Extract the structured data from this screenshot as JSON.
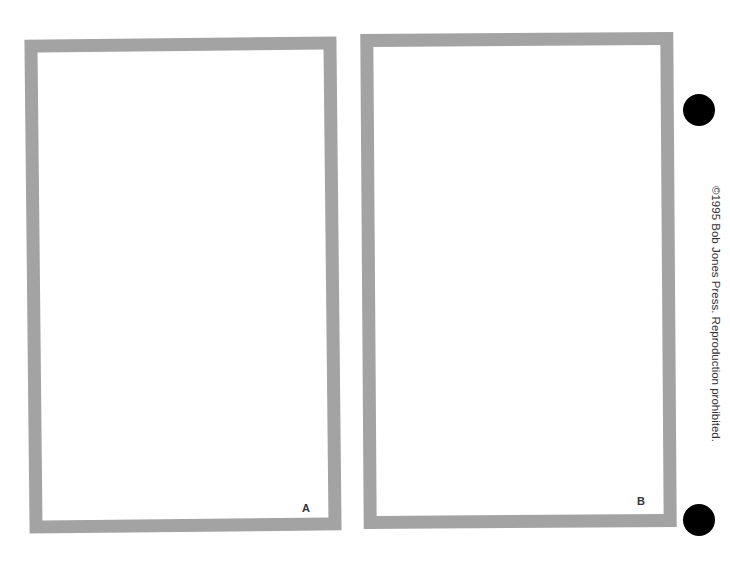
{
  "page": {
    "cards": [
      {
        "label": "A"
      },
      {
        "label": "B"
      }
    ],
    "copyright": "©1995 Bob Jones Press. Reproduction prohibited.",
    "colors": {
      "frame": "#a3a3a3",
      "background": "#ffffff",
      "holes": "#000000"
    }
  }
}
